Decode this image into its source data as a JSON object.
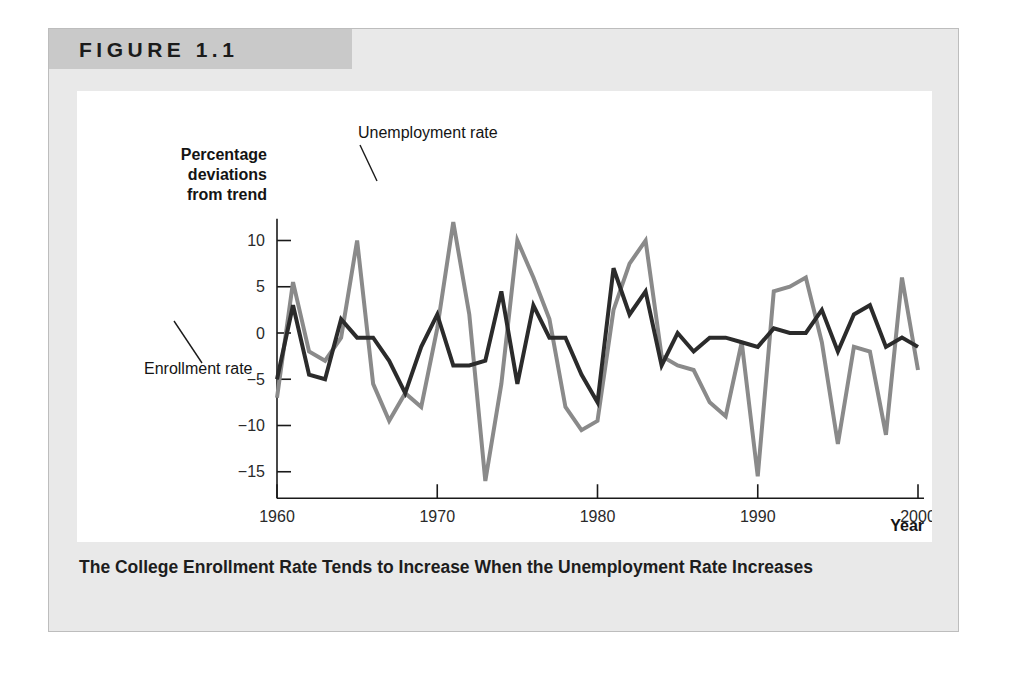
{
  "figure": {
    "header_label": "FIGURE 1.1",
    "caption": "The College Enrollment Rate Tends to Increase When the Unemployment Rate Increases"
  },
  "chart_data": {
    "type": "line",
    "title": "",
    "xlabel": "Year",
    "ylabel": "Percentage deviations from trend",
    "ylabel_lines": [
      "Percentage",
      "deviations",
      "from trend"
    ],
    "xlim": [
      1960,
      2000
    ],
    "ylim": [
      -17,
      13
    ],
    "xticks": [
      1960,
      1970,
      1980,
      1990,
      2000
    ],
    "xtick_labels": [
      "1960",
      "1970",
      "1980",
      "1990",
      "2000"
    ],
    "yticks": [
      10,
      5,
      0,
      -5,
      -10,
      -15
    ],
    "ytick_labels": [
      "10",
      "5",
      "0",
      "−5",
      "−10",
      "−15"
    ],
    "grid": false,
    "legend_position": "inline-annotations",
    "x": [
      1960,
      1961,
      1962,
      1963,
      1964,
      1965,
      1966,
      1967,
      1968,
      1969,
      1970,
      1971,
      1972,
      1973,
      1974,
      1975,
      1976,
      1977,
      1978,
      1979,
      1980,
      1981,
      1982,
      1983,
      1984,
      1985,
      1986,
      1987,
      1988,
      1989,
      1990,
      1991,
      1992,
      1993,
      1994,
      1995,
      1996,
      1997,
      1998,
      1999,
      2000
    ],
    "series": [
      {
        "name": "Unemployment rate",
        "color": "#8a8a8a",
        "values": [
          -7.0,
          5.5,
          -2.0,
          -3.0,
          -0.5,
          10.0,
          -5.5,
          -9.5,
          -6.5,
          -8.0,
          0.5,
          12.0,
          2.0,
          -16.0,
          -5.5,
          10.0,
          6.0,
          1.5,
          -8.0,
          -10.5,
          -9.5,
          2.5,
          7.5,
          10.0,
          -2.5,
          -3.5,
          -4.0,
          -7.5,
          -9.0,
          -1.0,
          -15.5,
          4.5,
          5.0,
          6.0,
          -1.0,
          -12.0,
          -1.5,
          -2.0,
          -11.0,
          6.0,
          -4.0
        ]
      },
      {
        "name": "Enrollment rate",
        "color": "#2b2b2b",
        "values": [
          -5.0,
          3.0,
          -4.5,
          -5.0,
          1.5,
          -0.5,
          -0.5,
          -3.0,
          -6.5,
          -1.5,
          2.0,
          -3.5,
          -3.5,
          -3.0,
          4.5,
          -5.5,
          3.0,
          -0.5,
          -0.5,
          -4.5,
          -7.5,
          7.0,
          2.0,
          4.5,
          -3.5,
          0.0,
          -2.0,
          -0.5,
          -0.5,
          -1.0,
          -1.5,
          0.5,
          0.0,
          0.0,
          2.5,
          -2.0,
          2.0,
          3.0,
          -1.5,
          -0.5,
          -1.5
        ]
      }
    ],
    "annotations": [
      {
        "text": "Unemployment rate",
        "series": "Unemployment rate"
      },
      {
        "text": "Enrollment rate",
        "series": "Enrollment rate"
      }
    ]
  }
}
